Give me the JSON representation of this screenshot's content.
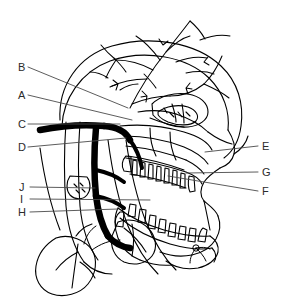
{
  "figure": {
    "background_color": "#ffffff",
    "ink_color": "#000000",
    "label_color": "#2b2b2b",
    "style": "black-and-white line art, no shading",
    "width": 283,
    "height": 305
  },
  "labels": [
    {
      "key": "B",
      "text": "B",
      "x": 18,
      "y": 62,
      "leader_to": [
        128,
        108
      ]
    },
    {
      "key": "A",
      "text": "A",
      "x": 18,
      "y": 90,
      "leader_to": [
        132,
        120
      ]
    },
    {
      "key": "C",
      "text": "C",
      "x": 18,
      "y": 119,
      "leader_to": [
        120,
        124
      ]
    },
    {
      "key": "D",
      "text": "D",
      "x": 18,
      "y": 142,
      "leader_to": [
        126,
        138
      ]
    },
    {
      "key": "J",
      "text": "J",
      "x": 19,
      "y": 182,
      "leader_to": [
        95,
        188
      ]
    },
    {
      "key": "I",
      "text": "I",
      "x": 20,
      "y": 194,
      "leader_to": [
        150,
        200
      ]
    },
    {
      "key": "H",
      "text": "H",
      "x": 18,
      "y": 207,
      "leader_to": [
        118,
        209
      ]
    },
    {
      "key": "E",
      "text": "E",
      "x": 262,
      "y": 141,
      "leader_to": [
        205,
        152
      ]
    },
    {
      "key": "G",
      "text": "G",
      "x": 262,
      "y": 167,
      "leader_to": [
        186,
        173
      ]
    },
    {
      "key": "F",
      "text": "F",
      "x": 262,
      "y": 186,
      "leader_to": [
        168,
        176
      ]
    }
  ],
  "structures": {
    "left_group": [
      "scalp vessels",
      "carotid artery trunk",
      "jugular vein",
      "glandular lobe"
    ],
    "right_group": [
      "facial profile",
      "maxilla",
      "upper teeth",
      "mandible",
      "lower teeth"
    ]
  }
}
